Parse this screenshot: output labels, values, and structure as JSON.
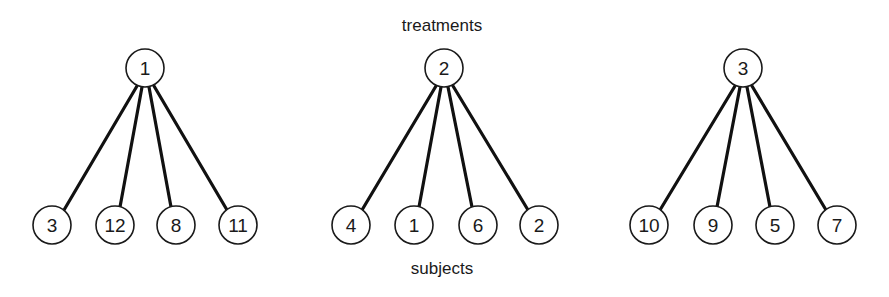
{
  "labels": {
    "top": "treatments",
    "bottom": "subjects"
  },
  "colors": {
    "stroke": "#1a1a1a",
    "background": "#ffffff"
  },
  "groups": [
    {
      "treatment": "1",
      "subjects": [
        "3",
        "12",
        "8",
        "11"
      ]
    },
    {
      "treatment": "2",
      "subjects": [
        "4",
        "1",
        "6",
        "2"
      ]
    },
    {
      "treatment": "3",
      "subjects": [
        "10",
        "9",
        "5",
        "7"
      ]
    }
  ]
}
